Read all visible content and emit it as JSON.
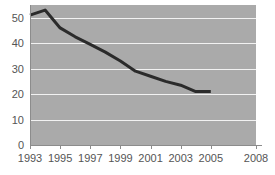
{
  "chart_data": {
    "type": "line",
    "title": "",
    "subtitle": "",
    "xlabel": "",
    "ylabel": "",
    "grid": "horizontal",
    "legend": "none",
    "xlim": [
      1993,
      2008
    ],
    "ylim": [
      0,
      55
    ],
    "x_ticks": [
      1993,
      1995,
      1997,
      1999,
      2001,
      2003,
      2005,
      2008
    ],
    "x_tick_labels": [
      "1993",
      "1995",
      "1997",
      "1999",
      "2001",
      "2003",
      "2005",
      "2008"
    ],
    "y_ticks": [
      0,
      10,
      20,
      30,
      40,
      50
    ],
    "y_tick_labels": [
      "0",
      "10",
      "20",
      "30",
      "40",
      "50"
    ],
    "series": [
      {
        "name": "value",
        "color": "#2b2b2b",
        "x": [
          1993,
          1994,
          1995,
          1996,
          1997,
          1998,
          1999,
          2000,
          2001,
          2002,
          2003,
          2004,
          2005
        ],
        "values": [
          51,
          53,
          46,
          42.5,
          39.5,
          36.5,
          33,
          29,
          27,
          25,
          23.5,
          21,
          21
        ]
      }
    ]
  },
  "style": {
    "plot_background": "#aaaaaa",
    "gridline_color": "#f2f2f2",
    "axis_color": "#8c8c8c",
    "tick_label_color": "#555555",
    "line_color": "#2b2b2b",
    "page_background": "#ffffff"
  }
}
